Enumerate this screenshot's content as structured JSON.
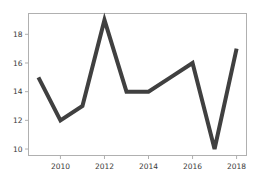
{
  "chart_data": {
    "type": "line",
    "title": "",
    "xlabel": "",
    "ylabel": "",
    "x": [
      2009,
      2010,
      2011,
      2012,
      2013,
      2014,
      2015,
      2016,
      2017,
      2018
    ],
    "values": [
      15,
      12,
      13,
      19,
      14,
      14,
      15,
      16,
      10,
      17
    ],
    "series": [
      {
        "name": "series-1",
        "values": [
          15,
          12,
          13,
          19,
          14,
          14,
          15,
          16,
          10,
          17
        ]
      }
    ],
    "xlim": [
      2008.55,
      2018.45
    ],
    "ylim": [
      9.55,
      19.45
    ],
    "xticks": [
      2010,
      2012,
      2014,
      2016,
      2018
    ],
    "xticklabels": [
      "2010",
      "2012",
      "2014",
      "2016",
      "2018"
    ],
    "yticks": [
      10,
      12,
      14,
      16,
      18
    ],
    "yticklabels": [
      "10",
      "12",
      "14",
      "16",
      "18"
    ],
    "grid": false,
    "legend": false,
    "legend_position": "none",
    "line_color": "#404040",
    "line_width": 4,
    "marker": "none",
    "frame_color": "#b0b0b0",
    "background_color": "#ffffff",
    "tick_color": "#3a3a3a"
  }
}
